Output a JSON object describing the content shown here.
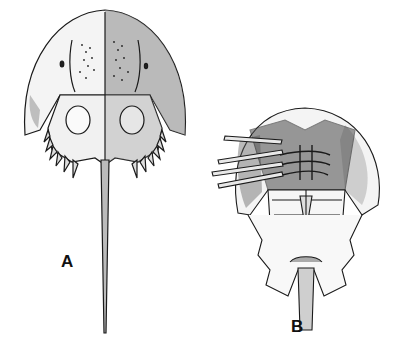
{
  "figure": {
    "panels": [
      {
        "label": "A",
        "view": "dorsal"
      },
      {
        "label": "B",
        "view": "ventral"
      }
    ],
    "colors": {
      "ink": "#1a1a1a",
      "background": "#ffffff",
      "shade": "#6b6b6b"
    }
  }
}
